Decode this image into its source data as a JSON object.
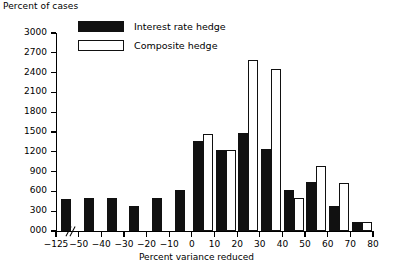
{
  "chart_data": {
    "type": "bar",
    "title": "",
    "ylabel": "Percent of cases",
    "xlabel": "Percent variance reduced",
    "ylim": [
      0,
      3000
    ],
    "ytick_labels": [
      "000",
      "300",
      "600",
      "900",
      "1200",
      "1500",
      "1800",
      "2100",
      "2400",
      "2700",
      "3000"
    ],
    "ytick_values": [
      0,
      300,
      600,
      900,
      1200,
      1500,
      1800,
      2100,
      2400,
      2700,
      3000
    ],
    "xtick_labels": [
      "−125",
      "−50",
      "−40",
      "−30",
      "−20",
      "−10",
      "0",
      "10",
      "20",
      "30",
      "40",
      "50",
      "60",
      "70",
      "80"
    ],
    "axis_break": true,
    "axis_break_note": "double-slash break on x-axis between −125 and −50",
    "grid": false,
    "legend_position": "upper left inside",
    "legend": [
      {
        "name": "Interest rate hedge",
        "fill": "#111111",
        "style": "solid"
      },
      {
        "name": "Composite hedge",
        "fill": "#ffffff",
        "style": "outline"
      }
    ],
    "categories": [
      "−125 to −50",
      "−50 to −40",
      "−40 to −30",
      "−30 to −20",
      "−20 to −10",
      "−10 to 0",
      "0 to 10",
      "10 to 20",
      "20 to 30",
      "30 to 40",
      "40 to 50",
      "50 to 60",
      "60 to 70",
      "70 to 80"
    ],
    "series": [
      {
        "name": "Interest rate hedge",
        "values": [
          490,
          500,
          500,
          375,
          500,
          615,
          1370,
          1230,
          1490,
          1240,
          620,
          740,
          375,
          130
        ]
      },
      {
        "name": "Composite hedge",
        "values": [
          null,
          null,
          null,
          null,
          null,
          null,
          1465,
          1225,
          2590,
          2460,
          495,
          985,
          735,
          130
        ]
      }
    ]
  },
  "colors": {
    "dark": "#111111",
    "light": "#ffffff",
    "axis": "#000000"
  }
}
